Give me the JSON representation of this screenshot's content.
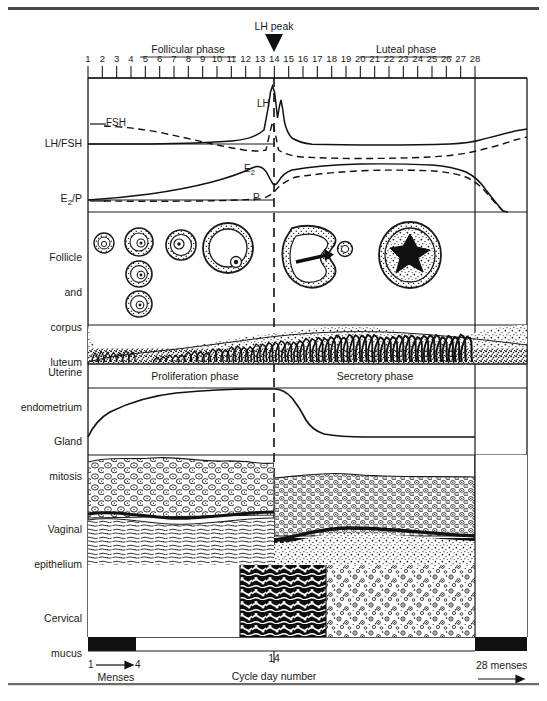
{
  "figure": {
    "type": "medical-diagram",
    "rule_top": true,
    "rule_bottom": true
  },
  "axis": {
    "label_bottom": "Cycle day number",
    "days": [
      1,
      2,
      3,
      4,
      5,
      6,
      7,
      8,
      9,
      10,
      11,
      12,
      13,
      14,
      15,
      16,
      17,
      18,
      19,
      20,
      21,
      22,
      23,
      24,
      25,
      26,
      27,
      28
    ],
    "day_first": 1,
    "day_mid": 14,
    "day_last": 28,
    "phases": [
      {
        "name": "Follicular phase",
        "start_day": 1,
        "end_day": 14
      },
      {
        "name": "Luteal phase",
        "start_day": 14,
        "end_day": 28
      }
    ],
    "marker": {
      "label": "LH peak",
      "day": 14,
      "glyph": "down-triangle"
    },
    "ovulation_line_day": 14
  },
  "menses": {
    "left_label_start": "1",
    "left_label_end": "4",
    "left_caption": "Menses",
    "left_start_day": 1,
    "left_end_day": 4,
    "right_label": "28 menses",
    "right_start_day": 28,
    "bar_color": "#111111"
  },
  "rows": [
    {
      "id": "hormones-gonadotropin",
      "label": "LH/FSH",
      "curves": [
        {
          "name": "LH",
          "style": "solid",
          "annotation": "LH"
        },
        {
          "name": "FSH",
          "style": "dashed",
          "annotation": "FSH"
        }
      ]
    },
    {
      "id": "hormones-steroid",
      "label": "E₂/P",
      "curves": [
        {
          "name": "E2",
          "style": "solid",
          "annotation": "E₂"
        },
        {
          "name": "P",
          "style": "dashed",
          "annotation": "P"
        }
      ]
    },
    {
      "id": "follicle-corpus-luteum",
      "label": "Follicle\nand\ncorpus\nluteum",
      "label_lines": [
        "Follicle",
        "and",
        "corpus",
        "luteum"
      ]
    },
    {
      "id": "uterine-endometrium",
      "label": "Uterine\nendometrium",
      "label_lines": [
        "Uterine",
        "endometrium"
      ],
      "sub_labels": [
        {
          "text": "Proliferation phase",
          "start_day": 1,
          "end_day": 14
        },
        {
          "text": "Secretory phase",
          "start_day": 14,
          "end_day": 28
        }
      ]
    },
    {
      "id": "gland-mitosis",
      "label": "Gland\nmitosis",
      "label_lines": [
        "Gland",
        "mitosis"
      ]
    },
    {
      "id": "vaginal-epithelium",
      "label": "Vaginal\nepithelium",
      "label_lines": [
        "Vaginal",
        "epithelium"
      ]
    },
    {
      "id": "cervical-mucus",
      "label": "Cervical\nmucus",
      "label_lines": [
        "Cervical",
        "mucus"
      ],
      "segments": [
        {
          "kind": "blank",
          "start_day": 1,
          "end_day": 10
        },
        {
          "kind": "ferning-dense",
          "start_day": 10,
          "end_day": 17
        },
        {
          "kind": "stippled",
          "start_day": 17,
          "end_day": 28
        }
      ]
    }
  ],
  "chart_data": {
    "type": "line",
    "xlabel": "Cycle day number",
    "xlim": [
      1,
      28
    ],
    "grid": false,
    "legend": "inline-annotations",
    "series": [
      {
        "name": "LH",
        "style": "solid",
        "panel": "LH/FSH",
        "x": [
          1,
          2,
          3,
          4,
          5,
          6,
          7,
          8,
          9,
          10,
          11,
          12,
          13,
          13.6,
          14,
          14.4,
          15,
          15.6,
          16,
          17,
          18,
          20,
          22,
          24,
          26,
          27,
          28
        ],
        "values": [
          10,
          10,
          10,
          10,
          10,
          10,
          10,
          10,
          10,
          11,
          12,
          14,
          20,
          60,
          100,
          62,
          26,
          34,
          22,
          16,
          13,
          11,
          11,
          11,
          12,
          14,
          18
        ]
      },
      {
        "name": "FSH",
        "style": "dashed",
        "panel": "LH/FSH",
        "x": [
          1,
          2,
          3,
          4,
          5,
          6,
          7,
          8,
          9,
          10,
          11,
          12,
          13,
          14,
          15,
          16,
          17,
          18,
          20,
          22,
          24,
          26,
          27,
          28
        ],
        "values": [
          30,
          27,
          24,
          21,
          18,
          15,
          12,
          10,
          8,
          7,
          7,
          8,
          14,
          42,
          18,
          10,
          8,
          7,
          6,
          6,
          7,
          10,
          14,
          20
        ]
      },
      {
        "name": "E2",
        "style": "solid",
        "panel": "E2/P",
        "x": [
          1,
          2,
          3,
          4,
          5,
          6,
          7,
          8,
          9,
          10,
          11,
          12,
          12.8,
          13.3,
          14,
          14.6,
          15,
          15.6,
          16,
          17,
          18,
          20,
          22,
          24,
          25,
          26,
          27,
          28
        ],
        "values": [
          6,
          6,
          7,
          8,
          9,
          11,
          13,
          16,
          20,
          25,
          33,
          46,
          62,
          70,
          66,
          40,
          34,
          44,
          50,
          54,
          57,
          60,
          60,
          58,
          52,
          38,
          20,
          10
        ]
      },
      {
        "name": "P",
        "style": "dashed",
        "panel": "E2/P",
        "x": [
          1,
          4,
          8,
          10,
          12,
          13,
          14,
          15,
          16,
          17,
          18,
          20,
          22,
          24,
          25,
          26,
          27,
          28
        ],
        "values": [
          4,
          4,
          4,
          5,
          6,
          8,
          12,
          22,
          34,
          44,
          50,
          56,
          58,
          57,
          52,
          40,
          22,
          9
        ]
      },
      {
        "name": "Gland mitosis",
        "style": "solid",
        "panel": "Gland mitosis",
        "x": [
          1,
          2,
          3,
          4,
          6,
          8,
          10,
          12,
          13,
          14,
          14.8,
          15.5,
          16,
          16.8,
          18,
          20,
          24,
          28
        ],
        "values": [
          0,
          14,
          30,
          44,
          64,
          76,
          84,
          88,
          89,
          89,
          86,
          70,
          44,
          22,
          14,
          12,
          12,
          12
        ]
      }
    ]
  }
}
